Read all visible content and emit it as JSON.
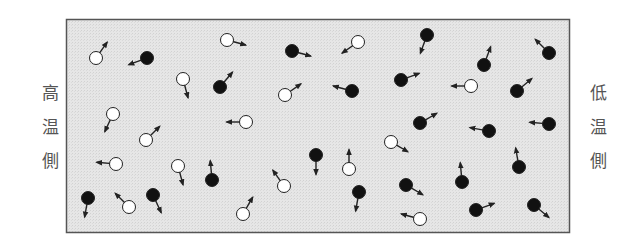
{
  "labels": {
    "left": [
      "高",
      "温",
      "側"
    ],
    "right": [
      "低",
      "温",
      "側"
    ]
  },
  "colors": {
    "box_fill": "#e4e4e4",
    "box_stroke": "#555555",
    "hot_particle": "#ffffff",
    "cold_particle": "#111111",
    "arrow": "#222222"
  },
  "particles": [
    {
      "type": "hot",
      "x": 96,
      "y": 58,
      "dir": -55
    },
    {
      "type": "cold",
      "x": 147,
      "y": 58,
      "dir": 160
    },
    {
      "type": "hot",
      "x": 227,
      "y": 40,
      "dir": 15
    },
    {
      "type": "cold",
      "x": 292,
      "y": 51,
      "dir": 15
    },
    {
      "type": "hot",
      "x": 358,
      "y": 42,
      "dir": 145
    },
    {
      "type": "cold",
      "x": 427,
      "y": 35,
      "dir": 110
    },
    {
      "type": "hot",
      "x": 183,
      "y": 79,
      "dir": 75
    },
    {
      "type": "cold",
      "x": 220,
      "y": 87,
      "dir": -50
    },
    {
      "type": "hot",
      "x": 285,
      "y": 95,
      "dir": -35
    },
    {
      "type": "cold",
      "x": 352,
      "y": 91,
      "dir": 195
    },
    {
      "type": "cold",
      "x": 401,
      "y": 80,
      "dir": -20
    },
    {
      "type": "hot",
      "x": 471,
      "y": 86,
      "dir": 180
    },
    {
      "type": "cold",
      "x": 484,
      "y": 65,
      "dir": -70
    },
    {
      "type": "cold",
      "x": 549,
      "y": 53,
      "dir": -135
    },
    {
      "type": "cold",
      "x": 517,
      "y": 91,
      "dir": -40
    },
    {
      "type": "hot",
      "x": 113,
      "y": 114,
      "dir": 115
    },
    {
      "type": "hot",
      "x": 146,
      "y": 140,
      "dir": -45
    },
    {
      "type": "hot",
      "x": 246,
      "y": 122,
      "dir": 180
    },
    {
      "type": "cold",
      "x": 420,
      "y": 123,
      "dir": -30
    },
    {
      "type": "cold",
      "x": 489,
      "y": 131,
      "dir": 190
    },
    {
      "type": "cold",
      "x": 549,
      "y": 124,
      "dir": 185
    },
    {
      "type": "hot",
      "x": 116,
      "y": 164,
      "dir": 185
    },
    {
      "type": "hot",
      "x": 178,
      "y": 166,
      "dir": 75
    },
    {
      "type": "cold",
      "x": 212,
      "y": 180,
      "dir": -95
    },
    {
      "type": "cold",
      "x": 316,
      "y": 155,
      "dir": 90
    },
    {
      "type": "hot",
      "x": 349,
      "y": 169,
      "dir": -90
    },
    {
      "type": "hot",
      "x": 391,
      "y": 142,
      "dir": 30
    },
    {
      "type": "hot",
      "x": 284,
      "y": 186,
      "dir": -125
    },
    {
      "type": "cold",
      "x": 88,
      "y": 198,
      "dir": 100
    },
    {
      "type": "hot",
      "x": 129,
      "y": 207,
      "dir": -135
    },
    {
      "type": "cold",
      "x": 153,
      "y": 195,
      "dir": 65
    },
    {
      "type": "hot",
      "x": 243,
      "y": 214,
      "dir": -60
    },
    {
      "type": "cold",
      "x": 359,
      "y": 192,
      "dir": 100
    },
    {
      "type": "cold",
      "x": 406,
      "y": 185,
      "dir": 30
    },
    {
      "type": "cold",
      "x": 462,
      "y": 182,
      "dir": -95
    },
    {
      "type": "cold",
      "x": 519,
      "y": 167,
      "dir": -100
    },
    {
      "type": "hot",
      "x": 420,
      "y": 219,
      "dir": 195
    },
    {
      "type": "cold",
      "x": 476,
      "y": 210,
      "dir": -20
    },
    {
      "type": "cold",
      "x": 534,
      "y": 205,
      "dir": 40
    }
  ]
}
